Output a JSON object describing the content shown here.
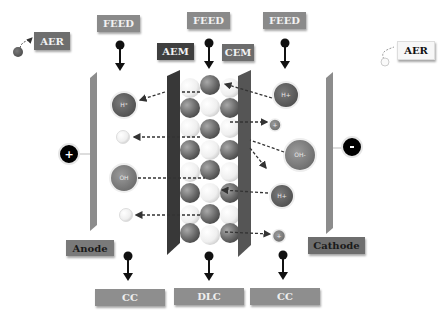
{
  "diagram": {
    "feeds": [
      {
        "label": "FEED",
        "x": 97
      },
      {
        "label": "FEED",
        "x": 187
      },
      {
        "label": "FEED",
        "x": 263
      }
    ],
    "membranes": {
      "aem": "AEM",
      "cem": "CEM"
    },
    "aer_left": "AER",
    "aer_right": "AER",
    "electrodes": {
      "anode": "Anode",
      "cathode": "Cathode"
    },
    "terminals": {
      "positive": "+",
      "negative": "-"
    },
    "outputs": [
      {
        "label": "CC"
      },
      {
        "label": "DLC"
      },
      {
        "label": "CC"
      }
    ],
    "ions_left": [
      {
        "label": "H⁺",
        "type": "large-dark"
      },
      {
        "label": "",
        "type": "small-white"
      },
      {
        "label": "OH",
        "type": "large-mid"
      },
      {
        "label": "",
        "type": "small-white"
      }
    ],
    "ions_right": [
      {
        "label": "H+",
        "type": "large-dark"
      },
      {
        "label": "+",
        "type": "small-mid"
      },
      {
        "label": "OH-",
        "type": "large-mid"
      },
      {
        "label": "H+",
        "type": "large-dark"
      },
      {
        "label": "+",
        "type": "small-white"
      }
    ],
    "colors": {
      "dark_label": "#3f3f3f",
      "mid_label": "#8a8a8a",
      "membrane": "#3a3a3a",
      "electrode": "#8a8a8a",
      "dark_sphere": "#7a7a7a",
      "light_sphere": "#f4f4f4"
    }
  }
}
